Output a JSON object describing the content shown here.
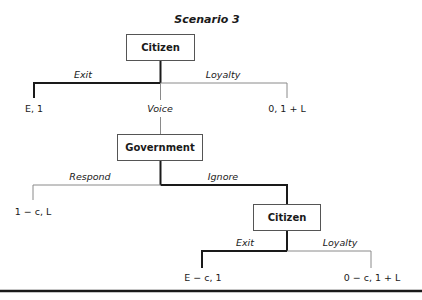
{
  "title": "Scenario 3",
  "nodes": {
    "citizen1": "Citizen",
    "government": "Government",
    "citizen2": "Citizen"
  },
  "edges": {
    "c1_exit": "Exit",
    "c1_loyalty": "Loyalty",
    "c1_voice": "Voice",
    "gov_respond": "Respond",
    "gov_ignore": "Ignore",
    "c2_exit": "Exit",
    "c2_loyalty": "Loyalty"
  },
  "payoffs": {
    "exit1": "E, 1",
    "loyalty1": "0, 1 + L",
    "respond": "1 − c, L",
    "exit2": "E − c, 1",
    "loyalty2": "0 − c, 1 + L"
  },
  "colors": {
    "thick_line": "#1a1a1a",
    "thin_line": "#8a8a8a"
  }
}
